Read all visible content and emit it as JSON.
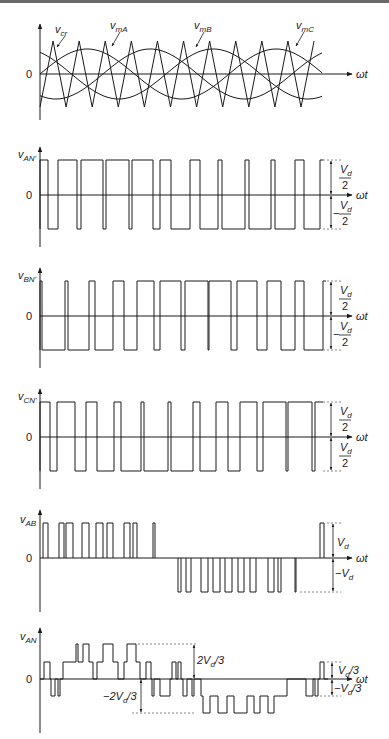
{
  "figure": {
    "time_axis_label": "ωt",
    "zero_label": "0",
    "panels": [
      {
        "id": "carrier-modulating",
        "signals": [
          {
            "name": "v_cr",
            "base": "v",
            "sub": "cr",
            "kind": "triangular carrier"
          },
          {
            "name": "v_mA",
            "base": "v",
            "sub": "mA",
            "kind": "sinusoid phase A"
          },
          {
            "name": "v_mB",
            "base": "v",
            "sub": "mB",
            "kind": "sinusoid phase B"
          },
          {
            "name": "v_mC",
            "base": "v",
            "sub": "mC",
            "kind": "sinusoid phase C"
          }
        ]
      },
      {
        "id": "van-prime",
        "ylabel_base": "v",
        "ylabel_sub": "AN'",
        "pos_label": {
          "num": "V",
          "num_sub": "d",
          "den": "2"
        },
        "neg_label": {
          "sign": "−",
          "num": "V",
          "num_sub": "d",
          "den": "2"
        },
        "high_segments": [
          [
            40,
            48
          ],
          [
            58,
            77
          ],
          [
            81,
            103
          ],
          [
            106,
            129
          ],
          [
            132,
            153
          ],
          [
            160,
            171
          ],
          [
            190,
            200
          ],
          [
            218,
            222
          ],
          [
            245,
            249
          ],
          [
            271,
            275
          ],
          [
            295,
            304
          ],
          [
            320,
            323
          ]
        ]
      },
      {
        "id": "vbn-prime",
        "ylabel_base": "v",
        "ylabel_sub": "BN'",
        "pos_label": {
          "num": "V",
          "num_sub": "d",
          "den": "2"
        },
        "neg_label": {
          "sign": "−",
          "num": "V",
          "num_sub": "d",
          "den": "2"
        },
        "high_segments": [
          [
            40,
            42
          ],
          [
            65,
            68
          ],
          [
            89,
            95
          ],
          [
            113,
            124
          ],
          [
            137,
            154
          ],
          [
            160,
            181
          ],
          [
            185,
            208
          ],
          [
            209,
            231
          ],
          [
            237,
            257
          ],
          [
            267,
            281
          ],
          [
            295,
            304
          ],
          [
            323,
            326
          ]
        ]
      },
      {
        "id": "vcn-prime",
        "ylabel_base": "v",
        "ylabel_sub": "CN'",
        "pos_label": {
          "num": "V",
          "num_sub": "d",
          "den": "2"
        },
        "neg_label": {
          "sign": "",
          "num": "V",
          "num_sub": "d",
          "den": "2"
        },
        "high_segments": [
          [
            40,
            50
          ],
          [
            57,
            75
          ],
          [
            86,
            97
          ],
          [
            114,
            121
          ],
          [
            141,
            144
          ],
          [
            168,
            171
          ],
          [
            193,
            200
          ],
          [
            216,
            228
          ],
          [
            240,
            257
          ],
          [
            263,
            286
          ],
          [
            288,
            312
          ],
          [
            315,
            323
          ]
        ]
      },
      {
        "id": "vab",
        "ylabel_base": "v",
        "ylabel_sub": "AB",
        "pos_label": {
          "text": "V",
          "sub": "d"
        },
        "neg_label": {
          "text": "−V",
          "sub": "d"
        }
      },
      {
        "id": "van",
        "ylabel_base": "v",
        "ylabel_sub": "AN",
        "levels": [
          "2V_d/3",
          "V_d/3",
          "0",
          "−V_d/3",
          "−2V_d/3"
        ],
        "label_2vd3": {
          "pre": "2V",
          "sub": "d",
          "post": "/3"
        },
        "label_vd3": {
          "pre": "V",
          "sub": "d",
          "post": "/3"
        },
        "label_neg_vd3": {
          "pre": "−V",
          "sub": "d",
          "post": "/3"
        },
        "label_neg_2vd3": {
          "pre": "−2V",
          "sub": "d",
          "post": "/3"
        }
      }
    ]
  },
  "colors": {
    "line": "#1a1a1a",
    "dashed": "#888888",
    "background": "#ffffff"
  }
}
